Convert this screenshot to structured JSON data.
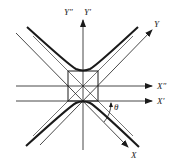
{
  "diagram": {
    "type": "hyperbola-rotated-axes",
    "colors": {
      "background": "#ffffff",
      "stroke": "#1a1a1a"
    },
    "labels": {
      "y_double_prime": "Y″",
      "y_prime": "Y′",
      "y": "Y",
      "x_double_prime": "X″",
      "x_prime": "X′",
      "x": "X",
      "theta": "θ"
    }
  }
}
